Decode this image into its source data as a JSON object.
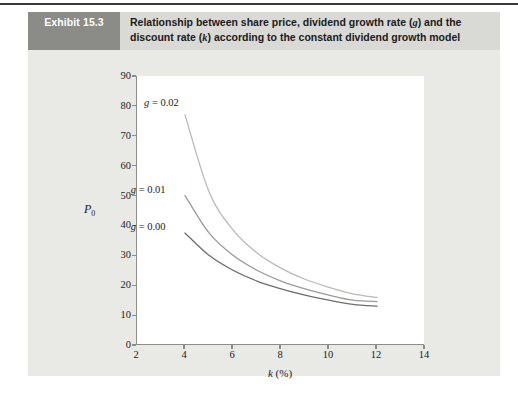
{
  "exhibit": {
    "badge": "Exhibit 15.3",
    "title_line1_a": "Relationship between share price, dividend growth rate (",
    "title_line1_g": "g",
    "title_line1_b": ") and the",
    "title_line2_a": "discount rate (",
    "title_line2_k": "k",
    "title_line2_b": ") according to the constant dividend growth model"
  },
  "colors": {
    "panel_bg": "#e9e9e6",
    "header_bg": "#d9d9d6",
    "badge_bg": "#8b8b88",
    "badge_text": "#ffffff",
    "plot_bg": "#ffffff",
    "axis": "#8d8d8a",
    "text": "#1b1b1b",
    "series_g002": "#b9b9b7",
    "series_g001": "#9a9a98",
    "series_g000": "#6e6e6c",
    "top_rule": "#3a3a38"
  },
  "chart_data": {
    "type": "line",
    "title": "Relationship between share price, dividend growth rate (g) and the discount rate (k) according to the constant dividend growth model",
    "xlabel": "k (%)",
    "ylabel": "P0",
    "xlim": [
      2,
      14
    ],
    "ylim": [
      0,
      90
    ],
    "xticks": [
      2,
      4,
      6,
      8,
      10,
      12,
      14
    ],
    "yticks": [
      0,
      10,
      20,
      30,
      40,
      50,
      60,
      70,
      80,
      90
    ],
    "grid": false,
    "legend": "inline-labels",
    "x": [
      4,
      5,
      6,
      7,
      8,
      9,
      10,
      11,
      12
    ],
    "series": [
      {
        "name": "g = 0.02",
        "label": "g = 0.02",
        "label_g": "g",
        "label_rest": " = 0.02",
        "color": "#b9b9b7",
        "values": [
          77.0,
          51.3,
          38.5,
          30.8,
          25.7,
          22.0,
          19.3,
          17.1,
          15.9
        ]
      },
      {
        "name": "g = 0.01",
        "label": "g = 0.01",
        "label_g": "g",
        "label_rest": " = 0.01",
        "color": "#9a9a98",
        "values": [
          50.0,
          37.5,
          30.0,
          25.0,
          21.4,
          18.8,
          16.7,
          15.0,
          14.5
        ]
      },
      {
        "name": "g = 0.00",
        "label": "g = 0.00",
        "label_g": "g",
        "label_rest": " = 0.00",
        "color": "#6e6e6c",
        "values": [
          37.5,
          30.0,
          25.0,
          21.4,
          18.8,
          16.7,
          15.0,
          13.6,
          13.0
        ]
      }
    ]
  }
}
